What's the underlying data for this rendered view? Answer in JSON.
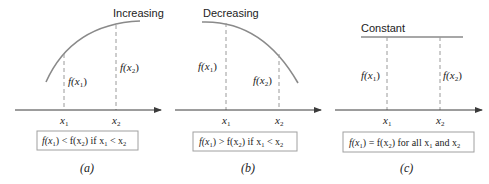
{
  "colors": {
    "curve": "#8a8a8a",
    "axis": "#3a3a3a",
    "dashed": "#9a9a9a",
    "box_border": "#a0a0a0",
    "text": "#222222"
  },
  "panels": [
    {
      "id": "a",
      "title": "Increasing",
      "caption": "(a)",
      "x1_label": "x",
      "x2_label": "x",
      "x1_sub": "1",
      "x2_sub": "2",
      "fx1": {
        "f": "f(",
        "x": "x",
        "sub": "1",
        "close": ")"
      },
      "fx2": {
        "f": "f(",
        "x": "x",
        "sub": "2",
        "close": ")"
      },
      "condition": {
        "lhs": "f(x",
        "lhs_sub": "1",
        "op": ") < f(x",
        "rhs_sub": "2",
        "mid": ") if x",
        "c_sub1": "1",
        "rel": " < x",
        "c_sub2": "2",
        "tail": ""
      }
    },
    {
      "id": "b",
      "title": "Decreasing",
      "caption": "(b)",
      "x1_label": "x",
      "x2_label": "x",
      "x1_sub": "1",
      "x2_sub": "2",
      "fx1": {
        "f": "f(",
        "x": "x",
        "sub": "1",
        "close": ")"
      },
      "fx2": {
        "f": "f(",
        "x": "x",
        "sub": "2",
        "close": ")"
      },
      "condition": {
        "lhs": "f(x",
        "lhs_sub": "1",
        "op": ") > f(x",
        "rhs_sub": "2",
        "mid": ") if x",
        "c_sub1": "1",
        "rel": " < x",
        "c_sub2": "2",
        "tail": ""
      }
    },
    {
      "id": "c",
      "title": "Constant",
      "caption": "(c)",
      "x1_label": "x",
      "x2_label": "x",
      "x1_sub": "1",
      "x2_sub": "2",
      "fx1": {
        "f": "f(",
        "x": "x",
        "sub": "1",
        "close": ")"
      },
      "fx2": {
        "f": "f(",
        "x": "x",
        "sub": "2",
        "close": ")"
      },
      "condition": {
        "lhs": "f(x",
        "lhs_sub": "1",
        "op": ") = f(x",
        "rhs_sub": "2",
        "mid": ") for all x",
        "c_sub1": "1",
        "rel": " and x",
        "c_sub2": "2",
        "tail": ""
      }
    }
  ]
}
